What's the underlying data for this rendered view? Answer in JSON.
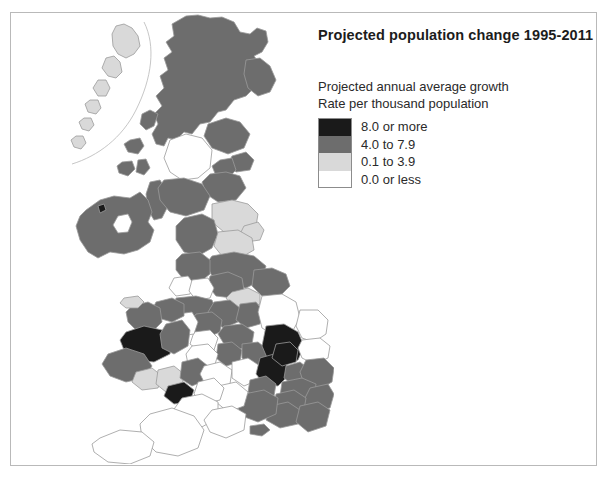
{
  "title": "Projected population change 1995-2011",
  "legend": {
    "heading_line1": "Projected annual average growth",
    "heading_line2": "Rate per thousand population",
    "classes": [
      {
        "label": "8.0 or more",
        "color": "#1a1a1a",
        "range_min": 8.0,
        "range_max": null
      },
      {
        "label": "4.0 to 7.9",
        "color": "#6d6d6d",
        "range_min": 4.0,
        "range_max": 7.9
      },
      {
        "label": "0.1 to 3.9",
        "color": "#d9d9d9",
        "range_min": 0.1,
        "range_max": 3.9
      },
      {
        "label": "0.0 or less",
        "color": "#ffffff",
        "range_min": null,
        "range_max": 0.0
      }
    ]
  },
  "map": {
    "region_name": "United Kingdom",
    "outline_color": "#9a9a9a",
    "background_color": "#ffffff",
    "frame_color": "#b9b9b9",
    "areas": [
      {
        "name": "highland-scotland",
        "class": 1
      },
      {
        "name": "grampian-aberdeen",
        "class": 1
      },
      {
        "name": "tayside",
        "class": 1
      },
      {
        "name": "fife",
        "class": 1
      },
      {
        "name": "lothian-edinburgh",
        "class": 1
      },
      {
        "name": "strathclyde-glasgow",
        "class": 3
      },
      {
        "name": "dumfries-galloway",
        "class": 1
      },
      {
        "name": "borders-scotland",
        "class": 1
      },
      {
        "name": "western-isles",
        "class": 2
      },
      {
        "name": "northern-ireland",
        "class": 1
      },
      {
        "name": "lough-neagh",
        "class": 3
      },
      {
        "name": "northumberland",
        "class": 2
      },
      {
        "name": "tyne-and-wear",
        "class": 2
      },
      {
        "name": "cumbria",
        "class": 1
      },
      {
        "name": "durham",
        "class": 2
      },
      {
        "name": "north-yorkshire",
        "class": 1
      },
      {
        "name": "lancashire",
        "class": 1
      },
      {
        "name": "merseyside",
        "class": 3
      },
      {
        "name": "greater-manchester",
        "class": 3
      },
      {
        "name": "west-yorkshire",
        "class": 1
      },
      {
        "name": "south-yorkshire",
        "class": 2
      },
      {
        "name": "humberside",
        "class": 1
      },
      {
        "name": "cheshire",
        "class": 1
      },
      {
        "name": "derbyshire",
        "class": 1
      },
      {
        "name": "nottinghamshire",
        "class": 1
      },
      {
        "name": "lincolnshire",
        "class": 3
      },
      {
        "name": "staffordshire",
        "class": 1
      },
      {
        "name": "west-midlands",
        "class": 3
      },
      {
        "name": "leicestershire",
        "class": 1
      },
      {
        "name": "norfolk",
        "class": 3
      },
      {
        "name": "suffolk",
        "class": 3
      },
      {
        "name": "cambridgeshire",
        "class": 0
      },
      {
        "name": "northamptonshire",
        "class": 1
      },
      {
        "name": "warwickshire",
        "class": 1
      },
      {
        "name": "hereford-worcester",
        "class": 3
      },
      {
        "name": "shropshire",
        "class": 1
      },
      {
        "name": "gwynedd",
        "class": 1
      },
      {
        "name": "clwyd",
        "class": 1
      },
      {
        "name": "powys-ceredigion",
        "class": 0
      },
      {
        "name": "dyfed",
        "class": 1
      },
      {
        "name": "west-glamorgan",
        "class": 2
      },
      {
        "name": "mid-glamorgan",
        "class": 2
      },
      {
        "name": "south-glamorgan",
        "class": 0
      },
      {
        "name": "gwent",
        "class": 1
      },
      {
        "name": "gloucestershire",
        "class": 3
      },
      {
        "name": "oxfordshire",
        "class": 1
      },
      {
        "name": "buckinghamshire-milton-keynes",
        "class": 0
      },
      {
        "name": "bedfordshire",
        "class": 0
      },
      {
        "name": "hertfordshire",
        "class": 1
      },
      {
        "name": "essex",
        "class": 1
      },
      {
        "name": "greater-london",
        "class": 1
      },
      {
        "name": "kent",
        "class": 1
      },
      {
        "name": "surrey",
        "class": 1
      },
      {
        "name": "east-sussex",
        "class": 1
      },
      {
        "name": "west-sussex",
        "class": 1
      },
      {
        "name": "hampshire",
        "class": 1
      },
      {
        "name": "isle-of-wight",
        "class": 1
      },
      {
        "name": "berkshire",
        "class": 1
      },
      {
        "name": "wiltshire",
        "class": 3
      },
      {
        "name": "avon-bristol",
        "class": 3
      },
      {
        "name": "somerset",
        "class": 3
      },
      {
        "name": "dorset",
        "class": 3
      },
      {
        "name": "devon",
        "class": 3
      },
      {
        "name": "cornwall",
        "class": 3
      }
    ]
  }
}
